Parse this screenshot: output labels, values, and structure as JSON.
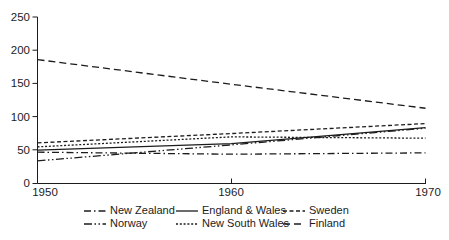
{
  "chart_data": {
    "type": "line",
    "x": [
      1950,
      1960,
      1970
    ],
    "xlim": [
      1950,
      1970
    ],
    "ylim": [
      0,
      250
    ],
    "xticks": [
      "1950",
      "1960",
      "1970"
    ],
    "yticks": [
      "0",
      "50",
      "100",
      "150",
      "200",
      "250"
    ],
    "title": "",
    "xlabel": "",
    "ylabel": "",
    "grid": false,
    "legend_position": "bottom",
    "line_color": "#1c1c1c",
    "series": [
      {
        "name": "New Zealand",
        "style": "dash-dot",
        "dash": "7,3,1.5,3",
        "values": [
          47,
          44,
          46
        ]
      },
      {
        "name": "England & Wales",
        "style": "solid",
        "dash": "",
        "values": [
          50,
          60,
          84
        ]
      },
      {
        "name": "Sweden",
        "style": "short-dash",
        "dash": "4,2.5",
        "values": [
          61,
          75,
          90
        ]
      },
      {
        "name": "Norway",
        "style": "dash-dot-dot",
        "dash": "8,2.5,1.5,2.5,1.5,2.5",
        "values": [
          34,
          58,
          83
        ]
      },
      {
        "name": "New South Wales",
        "style": "dense-dot",
        "dash": "2,1.8",
        "values": [
          55,
          70,
          68
        ]
      },
      {
        "name": "Finland",
        "style": "long-dash",
        "dash": "7,4",
        "values": [
          186,
          149,
          113
        ]
      }
    ]
  }
}
